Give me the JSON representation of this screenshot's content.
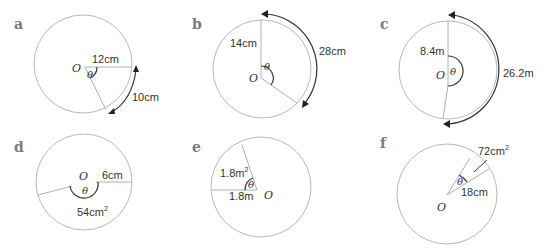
{
  "panels": {
    "a": {
      "label": "a",
      "center": "O",
      "angle": "θ",
      "radius": "12cm",
      "arc": "10cm"
    },
    "b": {
      "label": "b",
      "center": "O",
      "angle": "θ",
      "radius": "14cm",
      "arc": "28cm"
    },
    "c": {
      "label": "c",
      "center": "O",
      "angle": "θ",
      "radius": "8.4m",
      "arc": "26.2m"
    },
    "d": {
      "label": "d",
      "center": "O",
      "angle": "θ",
      "radius": "6cm",
      "area": "54cm",
      "area_sup": "2"
    },
    "e": {
      "label": "e",
      "center": "O",
      "angle": "θ",
      "radius": "1.8m",
      "area": "1.8m",
      "area_sup": "2"
    },
    "f": {
      "label": "f",
      "center": "O",
      "angle": "θ",
      "radius": "18cm",
      "area": "72cm",
      "area_sup": "2"
    }
  },
  "colors": {
    "circle": "#b8b8b8",
    "label": "#7a7a7a",
    "text": "#333333"
  }
}
